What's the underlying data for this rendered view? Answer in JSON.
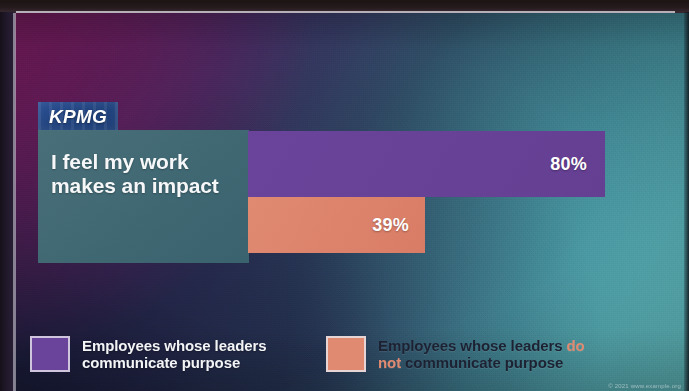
{
  "brand": {
    "logo_text": "KPMG",
    "logo_name": "kpmg-logo"
  },
  "question": {
    "label": "I feel my work\nmakes an\nimpact"
  },
  "legend": {
    "items": [
      {
        "swatch_name": "legend-swatch-purple",
        "color": "#6a449b",
        "text": "Employees whose leaders\ncommunicate purpose"
      },
      {
        "swatch_name": "legend-swatch-orange",
        "color": "#e08a72",
        "text_before": "Employees whose leaders ",
        "emphasis": "do\nnot",
        "text_after": " communicate purpose"
      }
    ]
  },
  "footer": {
    "copyright": "© 2021 www.example.org"
  },
  "chart_data": {
    "type": "bar",
    "orientation": "horizontal",
    "title": "I feel my work makes an impact",
    "categories": [
      "I feel my work makes an impact"
    ],
    "series": [
      {
        "name": "Employees whose leaders communicate purpose",
        "color": "#6a449b",
        "values": [
          80
        ],
        "labels": [
          "80%"
        ]
      },
      {
        "name": "Employees whose leaders do not communicate purpose",
        "color": "#e08a72",
        "values": [
          39
        ],
        "labels": [
          "39%"
        ]
      }
    ],
    "xlabel": "",
    "ylabel": "",
    "xlim": [
      0,
      100
    ],
    "unit": "%",
    "grid": false,
    "legend_position": "bottom",
    "value_80": "80%",
    "value_39": "39%"
  },
  "colors": {
    "purple": "#6a449b",
    "orange": "#e08a72",
    "teal_panel": "#48727a",
    "logo_blue": "#22447f",
    "legend_dark_text": "#1d2233"
  }
}
